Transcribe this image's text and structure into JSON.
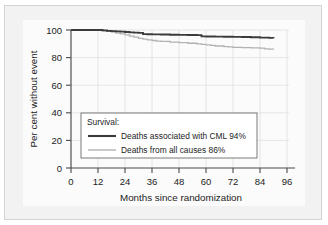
{
  "chart_data": {
    "type": "line",
    "title": "",
    "subtitle": "",
    "xlabel": "Months since randomization",
    "ylabel": "Per cent without event",
    "xlim": [
      0,
      96
    ],
    "ylim": [
      0,
      100
    ],
    "xticks": [
      0,
      12,
      24,
      36,
      48,
      60,
      72,
      84,
      96
    ],
    "yticks": [
      0,
      20,
      40,
      60,
      80,
      100
    ],
    "grid": true,
    "legend_position": "lower-left-inside",
    "legend_title": "Survival:",
    "series": [
      {
        "name": "Deaths associated with CML 94%",
        "label": "Deaths associated with CML 94%",
        "color": "#3b3b3b",
        "final_value": 94,
        "x": [
          0,
          6,
          12,
          14,
          16,
          18,
          20,
          22,
          24,
          26,
          28,
          30,
          32,
          34,
          36,
          40,
          44,
          48,
          52,
          56,
          58,
          60,
          64,
          68,
          72,
          76,
          80,
          84,
          88,
          90
        ],
        "y": [
          100,
          100,
          100,
          99.7,
          99.4,
          99.2,
          99.0,
          98.8,
          98.5,
          98.3,
          98.1,
          97.9,
          97.0,
          96.9,
          96.8,
          96.7,
          96.6,
          96.5,
          96.4,
          96.3,
          95.4,
          95.3,
          95.2,
          95.1,
          95.0,
          94.9,
          94.7,
          94.5,
          94.3,
          94.0
        ]
      },
      {
        "name": "Deaths from all causes 86%",
        "label": "Deaths from all causes 86%",
        "color": "#b2b2b2",
        "final_value": 86,
        "x": [
          0,
          6,
          12,
          14,
          16,
          18,
          20,
          22,
          24,
          26,
          28,
          30,
          32,
          34,
          36,
          38,
          40,
          44,
          48,
          52,
          56,
          58,
          60,
          62,
          64,
          68,
          70,
          72,
          76,
          80,
          84,
          86,
          88,
          90
        ],
        "y": [
          100,
          100,
          99.8,
          99.4,
          99.0,
          98.4,
          97.8,
          97.2,
          96.4,
          95.6,
          94.8,
          94.0,
          93.4,
          92.9,
          92.4,
          92.0,
          91.7,
          91.2,
          90.8,
          90.4,
          90.0,
          89.6,
          89.2,
          88.8,
          88.4,
          88.0,
          87.7,
          87.4,
          87.2,
          87.0,
          86.8,
          86.3,
          86.2,
          86.0
        ]
      }
    ]
  },
  "axes": {
    "y_title": "Per cent without event",
    "x_title": "Months since randomization",
    "y_tick_labels": [
      "0",
      "20",
      "40",
      "60",
      "80",
      "100"
    ],
    "x_tick_labels": [
      "0",
      "12",
      "24",
      "36",
      "48",
      "60",
      "72",
      "84",
      "96"
    ]
  },
  "legend": {
    "title": "Survival:",
    "entries": [
      {
        "label": "Deaths associated with CML 94%",
        "swatch": "dark-line-swatch"
      },
      {
        "label": "Deaths from all causes 86%",
        "swatch": "light-line-swatch"
      }
    ]
  },
  "colors": {
    "panel_background": "#f2f2f2",
    "plot_background": "#fbfbfb",
    "axis": "#4a4a4a",
    "grid": "#dfdfdf",
    "series_cml": "#3b3b3b",
    "series_all_causes": "#b2b2b2"
  }
}
